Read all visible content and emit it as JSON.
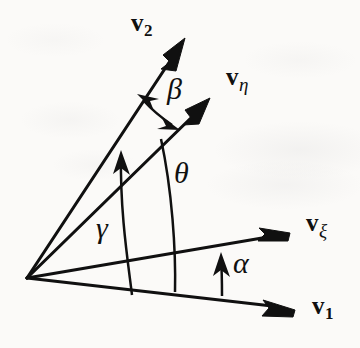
{
  "figure": {
    "background_color": "#fbfaf8",
    "ink_color": "#101010"
  },
  "vectors": [
    {
      "id": "v2",
      "name": "v-2",
      "base": "v",
      "subscript": "2",
      "subscript_kind": "numeric",
      "label_x": 131,
      "label_y": 10,
      "origin": [
        27,
        278
      ],
      "tip": [
        185,
        38
      ],
      "angle_deg": 56.6
    },
    {
      "id": "veta",
      "name": "v-eta",
      "base": "v",
      "subscript": "η",
      "subscript_kind": "greek",
      "label_x": 226,
      "label_y": 64,
      "origin": [
        27,
        278
      ],
      "tip": [
        210,
        98
      ],
      "angle_deg": 42.5
    },
    {
      "id": "vxi",
      "name": "v-xi",
      "base": "v",
      "subscript": "ξ",
      "subscript_kind": "greek",
      "label_x": 306,
      "label_y": 210,
      "origin": [
        27,
        278
      ],
      "tip": [
        290,
        233
      ],
      "angle_deg": 9.5
    },
    {
      "id": "v1",
      "name": "v-1",
      "base": "v",
      "subscript": "1",
      "subscript_kind": "numeric",
      "label_x": 312,
      "label_y": 293,
      "origin": [
        27,
        278
      ],
      "tip": [
        295,
        310
      ],
      "angle_deg": -6.3
    }
  ],
  "angles": [
    {
      "id": "beta",
      "symbol": "β",
      "label_x": 167,
      "label_y": 74,
      "between": [
        "v2",
        "veta"
      ],
      "arrowheads": "both",
      "radius": 128
    },
    {
      "id": "theta",
      "symbol": "θ",
      "label_x": 174,
      "label_y": 158,
      "between": [
        "vxi",
        "veta"
      ],
      "arrowheads": "start",
      "radius": 163
    },
    {
      "id": "gamma",
      "symbol": "γ",
      "label_x": 96,
      "label_y": 213,
      "between": [
        "v1",
        "v2"
      ],
      "arrowheads": "end",
      "radius": 107
    },
    {
      "id": "alpha",
      "symbol": "α",
      "label_x": 233,
      "label_y": 248,
      "between": [
        "v1",
        "vxi"
      ],
      "arrowheads": "end",
      "radius": 197
    }
  ]
}
